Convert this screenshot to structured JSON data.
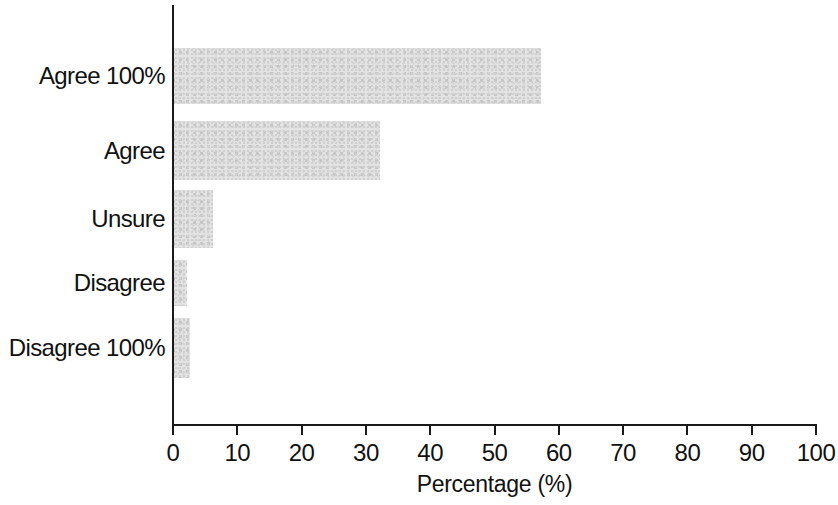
{
  "chart_data": {
    "type": "bar",
    "orientation": "horizontal",
    "title": "",
    "xlabel": "Percentage (%)",
    "ylabel": "",
    "categories": [
      "Agree 100%",
      "Agree",
      "Unsure",
      "Disagree",
      "Disagree 100%"
    ],
    "values": [
      57,
      32,
      6,
      2,
      2.5
    ],
    "xlim": [
      0,
      100
    ],
    "xticks": [
      0,
      10,
      20,
      30,
      40,
      50,
      60,
      70,
      80,
      90,
      100
    ],
    "xtick_labels": [
      "0",
      "10",
      "20",
      "30",
      "40",
      "50",
      "60",
      "70",
      "80",
      "90",
      "100"
    ],
    "grid": false,
    "legend": null,
    "bar_color": "#e3e3e3",
    "axis_color": "#1a1a1a",
    "text_color": "#111111"
  },
  "axis": {
    "x_title": "Percentage (%)"
  }
}
